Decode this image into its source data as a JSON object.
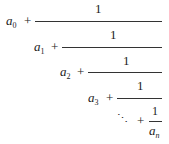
{
  "expression": {
    "levels": [
      {
        "term": "a",
        "sub": "0",
        "op": "+",
        "num": "1"
      },
      {
        "term": "a",
        "sub": "1",
        "op": "+",
        "num": "1"
      },
      {
        "term": "a",
        "sub": "2",
        "op": "+",
        "num": "1"
      },
      {
        "term": "a",
        "sub": "3",
        "op": "+",
        "num": "1"
      }
    ],
    "tail": {
      "dots": "⋱",
      "op": "+",
      "num": "1",
      "den_term": "a",
      "den_sub": "n"
    }
  }
}
